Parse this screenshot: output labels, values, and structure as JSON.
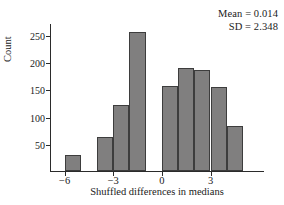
{
  "chart_data": {
    "type": "bar",
    "title": "",
    "subtitle": "",
    "xlabel": "Shuffled differences in medians",
    "ylabel": "Count",
    "xlim": [
      -6.9,
      6.3
    ],
    "ylim": [
      0,
      272
    ],
    "grid": false,
    "legend": null,
    "bin_width": 1,
    "x_ticks": [
      -6,
      -3,
      0,
      3
    ],
    "x_tick_labels": [
      "−6",
      "−3",
      "0",
      "3"
    ],
    "y_ticks": [
      50,
      100,
      150,
      200,
      250
    ],
    "y_tick_labels": [
      "50",
      "100",
      "150",
      "200",
      "250"
    ],
    "bin_starts": [
      -6,
      -5,
      -4,
      -3,
      -2,
      -1,
      0,
      1,
      2,
      3,
      4
    ],
    "bin_centers": [
      -5.5,
      -4.5,
      -3.5,
      -2.5,
      -1.5,
      -0.5,
      0.5,
      1.5,
      2.5,
      3.5,
      4.5
    ],
    "values": [
      30,
      0,
      62,
      121,
      256,
      0,
      157,
      190,
      186,
      155,
      83
    ],
    "bar_color": "#807f7f",
    "bar_edge_color": "#3d3d3d",
    "axis_color": "#2b2b2b",
    "annotations": [
      "Mean = 0.014",
      "SD = 2.348"
    ]
  },
  "stats": {
    "mean_line": "Mean = 0.014",
    "sd_line": "SD = 2.348"
  }
}
